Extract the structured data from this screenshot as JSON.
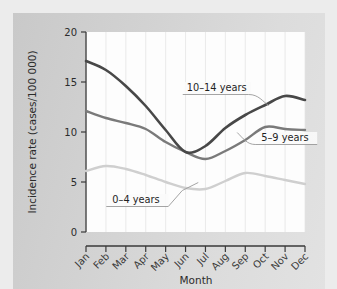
{
  "figure": {
    "background_color": "#ececec",
    "panel_color": "#d4d4d4",
    "plot_background": "#fdfdfd"
  },
  "chart_data": {
    "type": "line",
    "title": "",
    "xlabel": "Month",
    "ylabel": "Incidence rate (cases/100 000)",
    "categories": [
      "Jan",
      "Feb",
      "Mar",
      "Apr",
      "May",
      "Jun",
      "Jul",
      "Aug",
      "Sep",
      "Oct",
      "Nov",
      "Dec"
    ],
    "x": [
      1,
      2,
      3,
      4,
      5,
      6,
      7,
      8,
      9,
      10,
      11,
      12
    ],
    "xlim": [
      1,
      12
    ],
    "ylim": [
      0,
      20
    ],
    "yticks": [
      0,
      5,
      10,
      15,
      20
    ],
    "ytick_labels": [
      "0",
      "5",
      "10",
      "15",
      "20"
    ],
    "grid": "vertical-faint",
    "legend": "inline-callouts",
    "series": [
      {
        "name": "10-14 years",
        "label": "10–14 years",
        "color": "#484848",
        "linewidth": 2.6,
        "values": [
          17.1,
          16.2,
          14.6,
          12.6,
          10.2,
          8.0,
          8.6,
          10.4,
          11.7,
          12.7,
          13.6,
          13.2
        ]
      },
      {
        "name": "5-9 years",
        "label": "5–9 years",
        "color": "#7a7a7a",
        "linewidth": 2.4,
        "values": [
          12.1,
          11.4,
          10.9,
          10.3,
          9.0,
          8.0,
          7.3,
          8.1,
          9.2,
          10.5,
          10.3,
          10.2
        ]
      },
      {
        "name": "0-4 years",
        "label": "0–4 years",
        "color": "#cfcfcf",
        "linewidth": 2.4,
        "values": [
          6.1,
          6.6,
          6.3,
          5.7,
          5.0,
          4.4,
          4.3,
          5.1,
          5.9,
          5.6,
          5.2,
          4.8
        ]
      }
    ],
    "annotations": [
      {
        "text": "10–14 years",
        "x_frac": 0.46,
        "y_value": 14.1
      },
      {
        "text": "5–9 years",
        "x_frac": 0.8,
        "y_value": 9.1
      },
      {
        "text": "0–4 years",
        "x_frac": 0.12,
        "y_value": 2.9
      }
    ]
  }
}
